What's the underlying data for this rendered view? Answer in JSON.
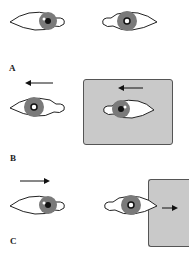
{
  "panels": [
    {
      "label": "A",
      "description": "Eyes looking left and right"
    },
    {
      "label": "B",
      "description": "Movement to the left with gray background"
    },
    {
      "label": "C",
      "description": "Movement to the right with gray background at edge"
    }
  ],
  "colors": {
    "background_panel": "#c9c9c9",
    "iris": "#7a7a7a",
    "outline": "#222222"
  }
}
